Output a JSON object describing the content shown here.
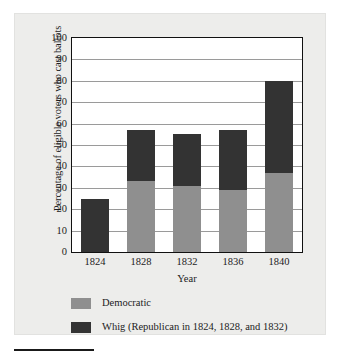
{
  "chart_data": {
    "type": "bar",
    "stacked": true,
    "title": "",
    "xlabel": "Year",
    "ylabel": "Percentage of eligible voters who cast ballots",
    "categories": [
      "1824",
      "1828",
      "1832",
      "1836",
      "1840"
    ],
    "ylim": [
      0,
      100
    ],
    "yticks": [
      0,
      10,
      20,
      30,
      40,
      50,
      60,
      70,
      80,
      90,
      100
    ],
    "ytick_labels": [
      "0",
      "10",
      "20",
      "30",
      "40",
      "50",
      "60",
      "70",
      "80",
      "90",
      "100"
    ],
    "grid": true,
    "legend_position": "below-axis",
    "series": [
      {
        "name": "Democratic",
        "color": "#8f8f8f",
        "values": [
          0,
          33,
          31,
          29,
          37
        ]
      },
      {
        "name": "Whig (Republican in 1824, 1828, and 1832)",
        "color": "#333333",
        "values": [
          25,
          24,
          24,
          28,
          43
        ]
      }
    ],
    "totals": [
      25,
      57,
      55,
      57,
      80
    ]
  },
  "legend": {
    "items": [
      {
        "label": "Democratic",
        "color": "#8f8f8f"
      },
      {
        "label": "Whig (Republican in 1824, 1828, and 1832)",
        "color": "#333333"
      }
    ]
  },
  "colors": {
    "democratic": "#8f8f8f",
    "whig": "#333333",
    "panel_background": "#ededeb",
    "plot_background": "#ffffff",
    "gridline": "#9a9a9a",
    "axis_frame": "#111111"
  }
}
